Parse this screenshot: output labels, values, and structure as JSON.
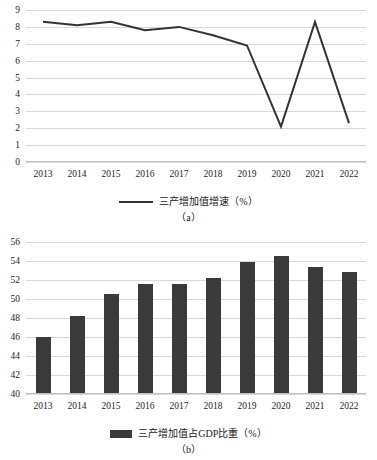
{
  "chart_data": [
    {
      "type": "line",
      "panel": "a",
      "caption": "（a）",
      "legend": [
        "三产增加值增速（%）"
      ],
      "legend_position": "bottom",
      "grid": true,
      "title": "",
      "xlabel": "",
      "ylabel": "",
      "categories": [
        "2013",
        "2014",
        "2015",
        "2016",
        "2017",
        "2018",
        "2019",
        "2020",
        "2021",
        "2022"
      ],
      "values": [
        8.3,
        8.1,
        8.3,
        7.8,
        8.0,
        7.5,
        6.9,
        2.1,
        8.3,
        2.3
      ],
      "series": [
        {
          "name": "三产增加值增速（%）",
          "values": [
            8.3,
            8.1,
            8.3,
            7.8,
            8.0,
            7.5,
            6.9,
            2.1,
            8.3,
            2.3
          ],
          "color": "#333333"
        }
      ],
      "ylim": [
        0,
        9
      ],
      "yticks": [
        "0",
        "1",
        "2",
        "3",
        "4",
        "5",
        "6",
        "7",
        "8",
        "9"
      ],
      "xticks": [
        "2013",
        "2014",
        "2015",
        "2016",
        "2017",
        "2018",
        "2019",
        "2020",
        "2021",
        "2022"
      ]
    },
    {
      "type": "bar",
      "panel": "b",
      "caption": "（b）",
      "legend": [
        "三产增加值占GDP比重（%）"
      ],
      "legend_position": "bottom",
      "grid": true,
      "title": "",
      "xlabel": "",
      "ylabel": "",
      "categories": [
        "2013",
        "2014",
        "2015",
        "2016",
        "2017",
        "2018",
        "2019",
        "2020",
        "2021",
        "2022"
      ],
      "values": [
        46.0,
        48.2,
        50.5,
        51.6,
        51.6,
        52.2,
        53.9,
        54.5,
        53.4,
        52.8
      ],
      "series": [
        {
          "name": "三产增加值占GDP比重（%）",
          "values": [
            46.0,
            48.2,
            50.5,
            51.6,
            51.6,
            52.2,
            53.9,
            54.5,
            53.4,
            52.8
          ],
          "color": "#3a3a3a"
        }
      ],
      "ylim": [
        40,
        56
      ],
      "yticks": [
        "40",
        "42",
        "44",
        "46",
        "48",
        "50",
        "52",
        "54",
        "56"
      ],
      "xticks": [
        "2013",
        "2014",
        "2015",
        "2016",
        "2017",
        "2018",
        "2019",
        "2020",
        "2021",
        "2022"
      ]
    }
  ],
  "colors": {
    "line": "#333333",
    "bar": "#3a3a3a",
    "grid": "#d9d9d9",
    "text": "#1a1a1a",
    "background": "#ffffff"
  }
}
